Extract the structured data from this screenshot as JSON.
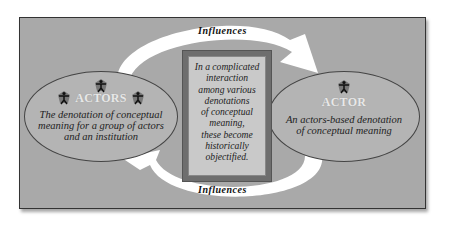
{
  "diagram": {
    "top_arrow_label": "Influences",
    "bottom_arrow_label": "Influences",
    "left_node": {
      "heading": "ACTORS",
      "description_lines": [
        "The denotation of conceptual",
        "meaning for a group of actors",
        "and an institution"
      ],
      "icon": "person-icon",
      "icon_count": 3
    },
    "right_node": {
      "heading": "ACTOR",
      "description_lines": [
        "An actors-based denotation",
        "of conceptual meaning"
      ],
      "icon": "person-icon",
      "icon_count": 1
    },
    "center_box": {
      "lines": [
        "In a complicated",
        "interaction",
        "among various",
        "denotations",
        "of conceptual",
        "meaning,",
        "these become",
        "historically",
        "objectified."
      ]
    },
    "colors": {
      "background": "#a9a9a9",
      "ellipse": "#b4b4b4",
      "center_outer": "#6e6e6e",
      "center_inner": "#c9c9c9",
      "arrow": "#ffffff"
    }
  }
}
